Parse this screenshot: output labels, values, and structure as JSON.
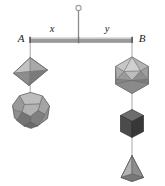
{
  "diagram": {
    "beam": {
      "left_endpoint_label": "A",
      "right_endpoint_label": "B",
      "left_segment_label": "x",
      "right_segment_label": "y",
      "beam_color": "#9a9a9a",
      "beam_highlight_color": "#c8c8c8",
      "beam_shadow_color": "#6e6e6e"
    },
    "support": {
      "rod_color": "#8c8c8c",
      "ring_color": "#9a9a9a",
      "ring_label": ""
    },
    "thread_color": "#9d9d9d",
    "left_arm": {
      "solids": [
        {
          "name": "octahedron",
          "faces_light": "#c2c2c2",
          "faces_mid": "#a6a6a6",
          "faces_dark": "#8a8a8a",
          "faces_darkest": "#767676",
          "outline": "#6a6a6a"
        },
        {
          "name": "dodecahedron",
          "faces_light": "#b8b8b8",
          "faces_mid": "#9c9c9c",
          "faces_dark": "#7e7e7e",
          "faces_darkest": "#666666",
          "outline": "#5c5c5c"
        }
      ]
    },
    "right_arm": {
      "solids": [
        {
          "name": "icosahedron",
          "faces_light": "#c6c6c6",
          "faces_mid": "#ababab",
          "faces_dark": "#8e8e8e",
          "faces_darkest": "#797979",
          "outline": "#6a6a6a"
        },
        {
          "name": "hexahedron-cube",
          "faces_light": "#6e6e6e",
          "faces_mid": "#575757",
          "faces_dark": "#414141",
          "faces_darkest": "#343434",
          "outline": "#2e2e2e"
        },
        {
          "name": "tetrahedron",
          "faces_light": "#b0b0b0",
          "faces_mid": "#949494",
          "faces_dark": "#7a7a7a",
          "faces_darkest": "#6a6a6a",
          "outline": "#5e5e5e"
        }
      ]
    }
  }
}
